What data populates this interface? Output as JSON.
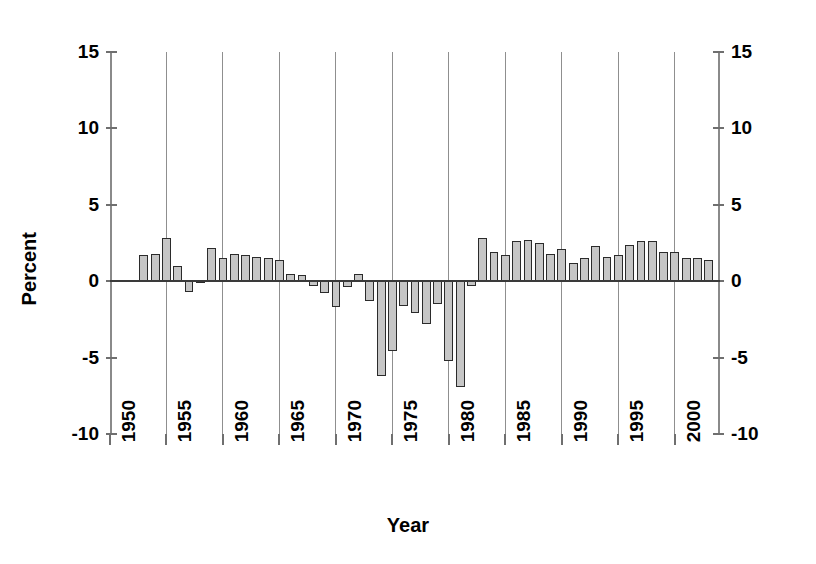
{
  "chart_data": {
    "type": "bar",
    "title": "",
    "subtitle": "",
    "xlabel": "Year",
    "ylabel": "Percent",
    "ylim": [
      -10,
      15
    ],
    "xlim": [
      1950,
      2004
    ],
    "y_ticks": [
      15,
      10,
      5,
      0,
      -5,
      -10
    ],
    "y_tick_labels_left": [
      "15",
      "10",
      "5",
      "0",
      "-5",
      "-10"
    ],
    "y_tick_labels_right": [
      "15",
      "10",
      "5",
      "0",
      "-5",
      "-10"
    ],
    "x_ticks": [
      1950,
      1955,
      1960,
      1965,
      1970,
      1975,
      1980,
      1985,
      1990,
      1995,
      2000
    ],
    "x_tick_labels": [
      "1950",
      "1955",
      "1960",
      "1965",
      "1970",
      "1975",
      "1980",
      "1985",
      "1990",
      "1995",
      "2000"
    ],
    "gridlines": {
      "vertical_at": [
        1955,
        1960,
        1965,
        1970,
        1975,
        1980,
        1985,
        1990,
        1995,
        2000
      ],
      "horizontal": false
    },
    "legend": null,
    "bar_fill_color": "#c6c6c6",
    "bar_edge_color": "#2b2b2b",
    "axis_color": "#8a8a8a",
    "zero_line_color": "#3a3a3a",
    "categories": [
      1952,
      1953,
      1954,
      1955,
      1956,
      1957,
      1958,
      1959,
      1960,
      1961,
      1962,
      1963,
      1964,
      1965,
      1966,
      1967,
      1968,
      1969,
      1970,
      1971,
      1972,
      1973,
      1974,
      1975,
      1976,
      1977,
      1978,
      1979,
      1980,
      1981,
      1982,
      1983,
      1984,
      1985,
      1986,
      1987,
      1988,
      1989,
      1990,
      1991,
      1992,
      1993,
      1994,
      1995,
      1996,
      1997,
      1998,
      1999,
      2000,
      2001,
      2002,
      2003
    ],
    "values": [
      0.1,
      1.7,
      1.8,
      2.8,
      1.0,
      -0.7,
      0.0,
      2.2,
      1.5,
      1.8,
      1.7,
      1.6,
      1.5,
      1.4,
      0.5,
      0.4,
      -0.3,
      -0.8,
      -1.7,
      -0.4,
      0.5,
      -1.3,
      -6.2,
      -4.6,
      -1.6,
      -2.1,
      -2.8,
      -1.5,
      -5.2,
      -6.9,
      -0.3,
      2.8,
      1.9,
      1.7,
      2.6,
      2.7,
      2.5,
      1.8,
      2.1,
      1.2,
      1.5,
      2.3,
      1.6,
      1.7,
      2.4,
      2.6,
      2.6,
      1.9,
      1.9,
      1.5,
      1.5,
      1.4
    ]
  },
  "axes": {
    "y_title": "Percent",
    "x_title": "Year"
  }
}
